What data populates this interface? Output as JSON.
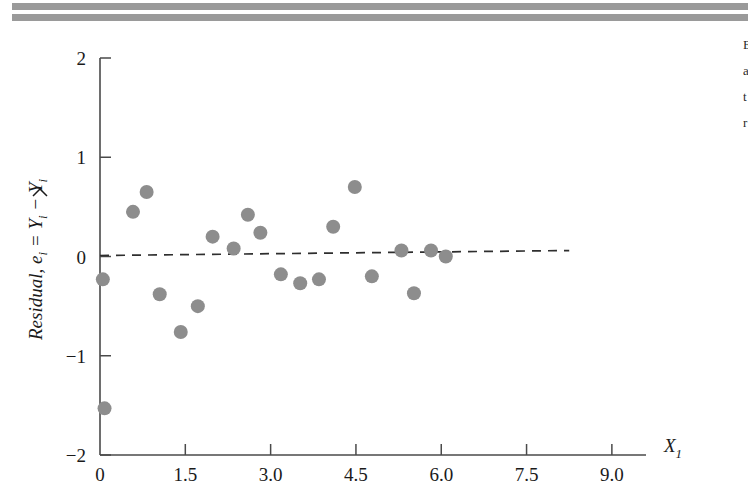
{
  "page": {
    "background_color": "#ffffff",
    "rule_color": "#9a9a9a"
  },
  "margin_text": {
    "lines": [
      "E",
      "a",
      "t",
      "r"
    ]
  },
  "chart_data": {
    "type": "scatter",
    "title": "",
    "xlabel": "X_1",
    "xlabel_base": "X",
    "xlabel_sub": "1",
    "ylabel": "Residual, e_i = Y_i - Y-hat_i",
    "ylabel_parts": {
      "word": "Residual,",
      "e": "e",
      "e_sub": "i",
      "eq": " = ",
      "Y1": "Y",
      "Y1_sub": "i",
      "minus": " − ",
      "Y2": "Y",
      "Y2_sub": "i"
    },
    "xlim": [
      0,
      9.6
    ],
    "ylim": [
      -2,
      2
    ],
    "xticks": [
      0,
      1.5,
      3.0,
      4.5,
      6.0,
      7.5,
      9.0
    ],
    "xticklabels": [
      "0",
      "1.5",
      "3.0",
      "4.5",
      "6.0",
      "7.5",
      "9.0"
    ],
    "yticks": [
      -2,
      -1,
      0,
      1,
      2
    ],
    "yticklabels": [
      "-2",
      "-1",
      "0",
      "1",
      "2"
    ],
    "grid": false,
    "legend": null,
    "marker_color": "#8d8d8d",
    "marker_size": 9,
    "reference_line": {
      "style": "dashed",
      "color": "#2e2e2e",
      "x_start": 0.0,
      "y_start": 0.01,
      "x_end": 8.25,
      "y_end": 0.06,
      "label": ""
    },
    "points": [
      {
        "x": 0.05,
        "y": -0.23
      },
      {
        "x": 0.08,
        "y": -1.53
      },
      {
        "x": 0.58,
        "y": 0.45
      },
      {
        "x": 0.82,
        "y": 0.65
      },
      {
        "x": 1.05,
        "y": -0.38
      },
      {
        "x": 1.42,
        "y": -0.76
      },
      {
        "x": 1.72,
        "y": -0.5
      },
      {
        "x": 1.98,
        "y": 0.2
      },
      {
        "x": 2.35,
        "y": 0.08
      },
      {
        "x": 2.6,
        "y": 0.42
      },
      {
        "x": 2.82,
        "y": 0.24
      },
      {
        "x": 3.18,
        "y": -0.18
      },
      {
        "x": 3.52,
        "y": -0.27
      },
      {
        "x": 3.85,
        "y": -0.23
      },
      {
        "x": 4.1,
        "y": 0.3
      },
      {
        "x": 4.48,
        "y": 0.7
      },
      {
        "x": 4.78,
        "y": -0.2
      },
      {
        "x": 5.3,
        "y": 0.06
      },
      {
        "x": 5.52,
        "y": -0.37
      },
      {
        "x": 5.82,
        "y": 0.06
      },
      {
        "x": 6.08,
        "y": 0.0
      }
    ]
  }
}
